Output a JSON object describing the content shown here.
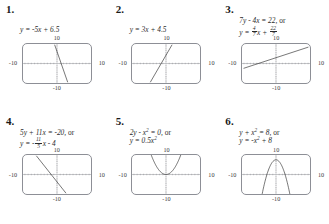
{
  "page": {
    "axis_labels": {
      "top": "10",
      "bottom": "-10",
      "left": "-10",
      "right": "10"
    }
  },
  "problems": [
    {
      "number": "1.",
      "equation_lines": [
        {
          "parts": [
            {
              "t": "y = -5x + 6.5",
              "k": "italic"
            }
          ]
        }
      ],
      "chart_data": {
        "type": "line",
        "title": "y = -5x + 6.5",
        "xlabel": "x",
        "ylabel": "y",
        "xlim": [
          -10,
          10
        ],
        "ylim": [
          -10,
          10
        ],
        "grid": false,
        "slope": -5,
        "intercept": 6.5,
        "x": [
          -0.7,
          3.3
        ],
        "y": [
          10,
          -10
        ]
      }
    },
    {
      "number": "2.",
      "equation_lines": [
        {
          "parts": [
            {
              "t": "y = 3x + 4.5",
              "k": "italic"
            }
          ]
        }
      ],
      "chart_data": {
        "type": "line",
        "title": "y = 3x + 4.5",
        "xlabel": "x",
        "ylabel": "y",
        "xlim": [
          -10,
          10
        ],
        "ylim": [
          -10,
          10
        ],
        "grid": false,
        "slope": 3,
        "intercept": 4.5,
        "x": [
          -4.83,
          1.83
        ],
        "y": [
          -10,
          10
        ]
      }
    },
    {
      "number": "3.",
      "equation_lines": [
        {
          "parts": [
            {
              "t": "7y - 4x = 22, ",
              "k": "italic"
            },
            {
              "t": "or",
              "k": "roman"
            }
          ]
        },
        {
          "parts": [
            {
              "t": "y = ",
              "k": "italic"
            },
            {
              "t": "",
              "k": "frac",
              "num": "4",
              "den": "7"
            },
            {
              "t": "x + ",
              "k": "italic"
            },
            {
              "t": "",
              "k": "frac",
              "num": "22",
              "den": "7"
            }
          ]
        }
      ],
      "chart_data": {
        "type": "line",
        "title": "7y - 4x = 22, or y = (4/7)x + 22/7",
        "xlabel": "x",
        "ylabel": "y",
        "xlim": [
          -10,
          10
        ],
        "ylim": [
          -10,
          10
        ],
        "grid": false,
        "slope": 0.5714,
        "intercept": 3.143,
        "x": [
          -10,
          10
        ],
        "y": [
          -2.57,
          8.86
        ]
      }
    },
    {
      "number": "4.",
      "equation_lines": [
        {
          "parts": [
            {
              "t": "5y + 11x = -20, ",
              "k": "italic"
            },
            {
              "t": "or",
              "k": "roman"
            }
          ]
        },
        {
          "parts": [
            {
              "t": "y = -",
              "k": "italic"
            },
            {
              "t": "",
              "k": "frac",
              "num": "11",
              "den": "5"
            },
            {
              "t": "x - 4",
              "k": "italic"
            }
          ]
        }
      ],
      "chart_data": {
        "type": "line",
        "title": "5y + 11x = -20, or y = -(11/5)x - 4",
        "xlabel": "x",
        "ylabel": "y",
        "xlim": [
          -10,
          10
        ],
        "ylim": [
          -10,
          10
        ],
        "grid": false,
        "slope": -2.2,
        "intercept": -4,
        "x": [
          -6.36,
          2.73
        ],
        "y": [
          10,
          -10
        ]
      }
    },
    {
      "number": "5.",
      "equation_lines": [
        {
          "parts": [
            {
              "t": "2y - x",
              "k": "italic"
            },
            {
              "t": "2",
              "k": "sup"
            },
            {
              "t": " = 0, ",
              "k": "italic"
            },
            {
              "t": "or",
              "k": "roman"
            }
          ]
        },
        {
          "parts": [
            {
              "t": "y = 0.5x",
              "k": "italic"
            },
            {
              "t": "2",
              "k": "sup"
            }
          ]
        }
      ],
      "chart_data": {
        "type": "line",
        "title": "2y - x^2 = 0, or y = 0.5x^2",
        "xlabel": "x",
        "ylabel": "y",
        "xlim": [
          -10,
          10
        ],
        "ylim": [
          -10,
          10
        ],
        "grid": false,
        "curve": "parabola",
        "a": 0.5,
        "h": 0,
        "k": 0,
        "vertex": [
          0,
          0
        ],
        "opens": "up"
      }
    },
    {
      "number": "6.",
      "equation_lines": [
        {
          "parts": [
            {
              "t": "y + x",
              "k": "italic"
            },
            {
              "t": "2",
              "k": "sup"
            },
            {
              "t": " = 8, ",
              "k": "italic"
            },
            {
              "t": "or",
              "k": "roman"
            }
          ]
        },
        {
          "parts": [
            {
              "t": "y = -x",
              "k": "italic"
            },
            {
              "t": "2",
              "k": "sup"
            },
            {
              "t": " + 8",
              "k": "italic"
            }
          ]
        }
      ],
      "chart_data": {
        "type": "line",
        "title": "y + x^2 = 8, or y = -x^2 + 8",
        "xlabel": "x",
        "ylabel": "y",
        "xlim": [
          -10,
          10
        ],
        "ylim": [
          -10,
          10
        ],
        "grid": false,
        "curve": "parabola",
        "a": -1,
        "h": 0,
        "k": 8,
        "vertex": [
          0,
          8
        ],
        "opens": "down"
      }
    }
  ],
  "style": {
    "curve_color": "#1c1c1c",
    "axis_color": "#7a7c82",
    "box_color": "#8d8f96",
    "text_color": "#2b2b2b"
  }
}
